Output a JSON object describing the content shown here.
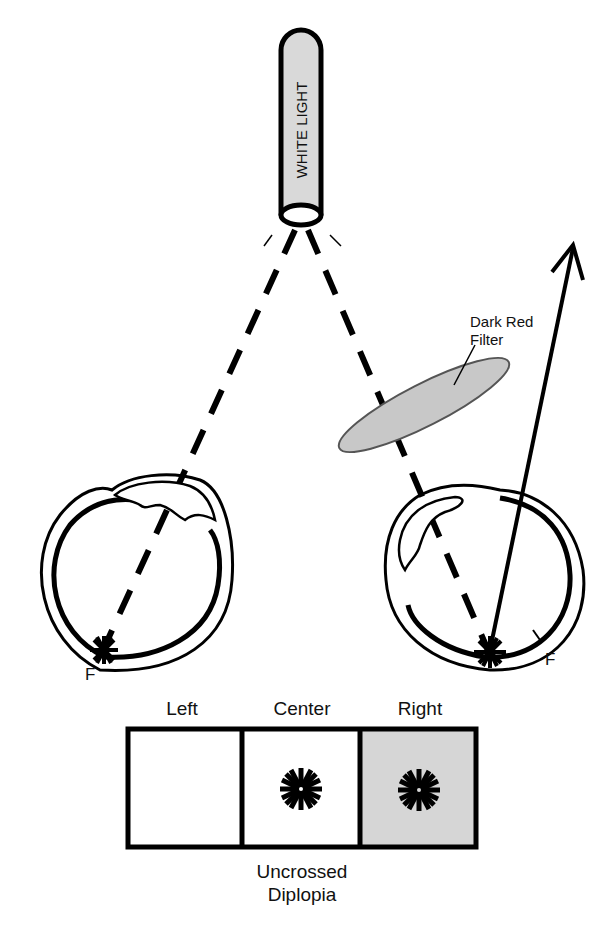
{
  "light_source": {
    "label": "WHITE LIGHT",
    "fill": "#d9d9d9"
  },
  "filter": {
    "label_line1": "Dark Red",
    "label_line2": "Filter",
    "fill": "#c8c8c8"
  },
  "left_eye": {
    "fovea_label": "F"
  },
  "right_eye": {
    "fovea_label": "F"
  },
  "panels": {
    "headers": [
      "Left",
      "Center",
      "Right"
    ],
    "right_fill": "#d6d6d6",
    "caption_line1": "Uncrossed",
    "caption_line2": "Diplopia"
  }
}
